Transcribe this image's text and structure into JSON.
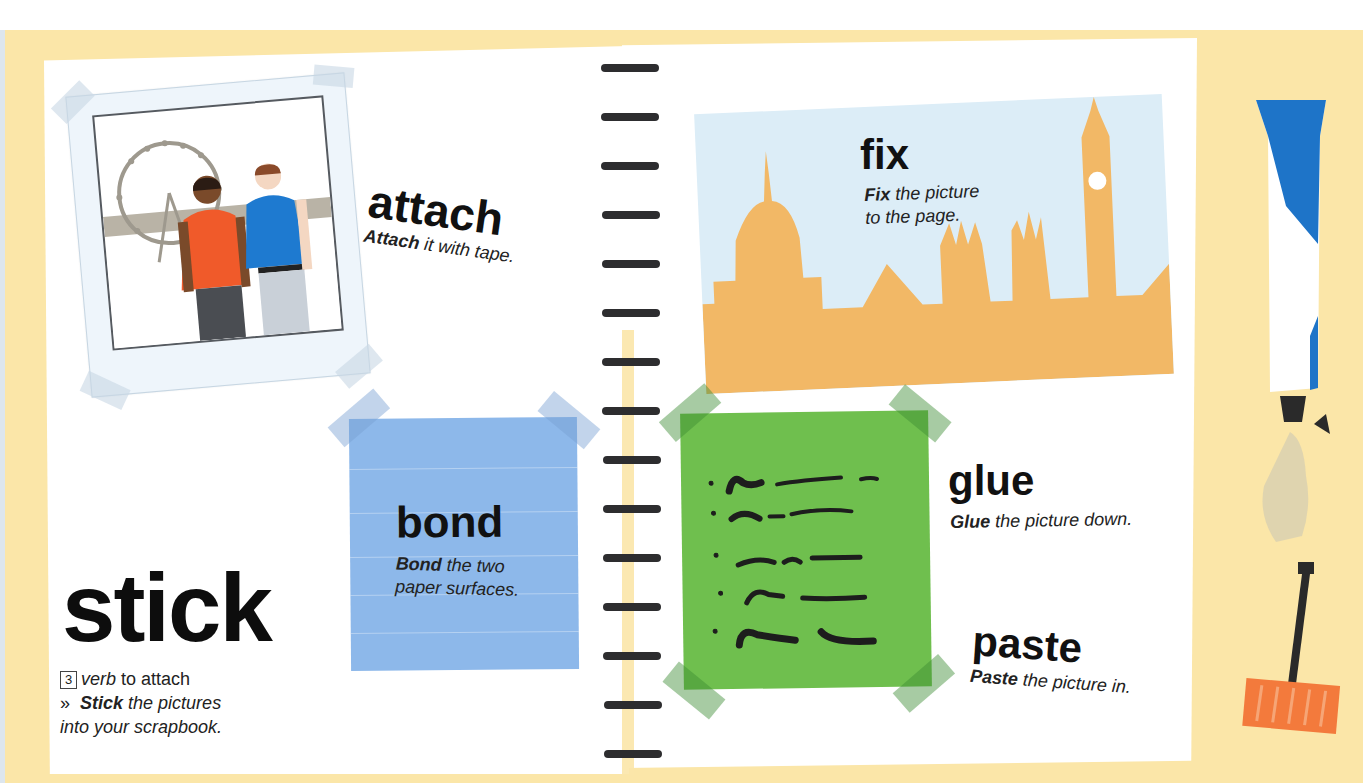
{
  "page": {
    "background_color": "#fbe6a8",
    "accent_colors": {
      "blue_note": "#8db8ea",
      "green_note": "#6fbf4e",
      "skyline": "#f2b866",
      "sky": "#dcedf7",
      "tube_blue": "#1e74c8",
      "spreader_orange": "#f37a3c"
    }
  },
  "entry": {
    "headword": "stick",
    "sense_number": "3",
    "part_of_speech": "verb",
    "definition": "to attach",
    "example_marker": "»",
    "example_bold": "Stick",
    "example_rest": "the pictures",
    "example_line2": "into your scrapbook."
  },
  "synonyms": [
    {
      "word": "attach",
      "example_bold": "Attach",
      "example_rest": " it with tape."
    },
    {
      "word": "bond",
      "example_bold": "Bond",
      "example_rest": " the two",
      "example_line2": "paper surfaces."
    },
    {
      "word": "fix",
      "example_bold": "Fix",
      "example_rest": " the picture",
      "example_line2": "to the page."
    },
    {
      "word": "glue",
      "example_bold": "Glue",
      "example_rest": " the picture down."
    },
    {
      "word": "paste",
      "example_bold": "Paste",
      "example_rest": " the picture in."
    }
  ],
  "illustrations": {
    "polaroid": "photo-of-two-men-by-london-eye",
    "skyline": "london-skyline-st-pauls-big-ben",
    "note": "handwritten-list-note",
    "tube": "glue-tube",
    "spreader": "glue-spreader"
  },
  "binder_rings": 15
}
